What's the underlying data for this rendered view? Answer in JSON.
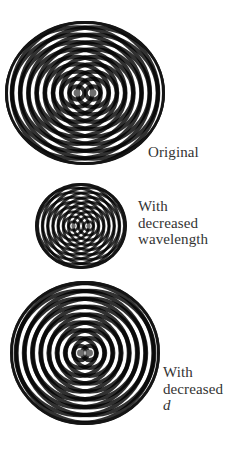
{
  "figure": {
    "background": "#ffffff",
    "ink_color": "#141414",
    "center_dot_color": "#6e6e6e",
    "panels": [
      {
        "id": "original",
        "caption_lines": [
          "Original"
        ],
        "caption_italic_last": false,
        "center": [
          85,
          93
        ],
        "radius": [
          80,
          72
        ],
        "sources_dx": [
          -8,
          8
        ],
        "ring_spacing": 8.2,
        "caption_pos": [
          148,
          144
        ]
      },
      {
        "id": "decreased-wavelength",
        "caption_lines": [
          "With",
          "decreased",
          "wavelength"
        ],
        "caption_italic_last": false,
        "center": [
          81,
          226
        ],
        "radius": [
          46,
          43
        ],
        "sources_dx": [
          -7.5,
          7.5
        ],
        "ring_spacing": 5.2,
        "caption_pos": [
          138,
          198
        ]
      },
      {
        "id": "decreased-d",
        "caption_lines": [
          "With",
          "decreased",
          "d"
        ],
        "caption_italic_last": true,
        "center": [
          85,
          353
        ],
        "radius": [
          75,
          72
        ],
        "sources_dx": [
          -4.5,
          4.5
        ],
        "ring_spacing": 8.2,
        "caption_pos": [
          163,
          364
        ]
      }
    ]
  }
}
